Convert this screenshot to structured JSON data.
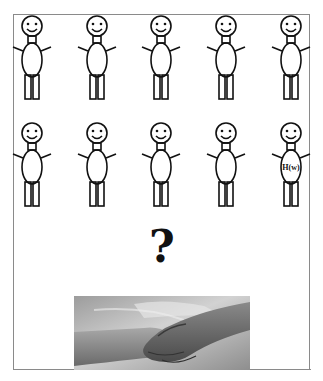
{
  "diagram": {
    "rows": [
      {
        "figures": [
          {
            "label": ""
          },
          {
            "label": ""
          },
          {
            "label": ""
          },
          {
            "label": ""
          },
          {
            "label": ""
          }
        ]
      },
      {
        "figures": [
          {
            "label": ""
          },
          {
            "label": ""
          },
          {
            "label": ""
          },
          {
            "label": ""
          },
          {
            "label": "H(w)"
          }
        ]
      }
    ],
    "question_mark": "?",
    "photo": {
      "subject": "handshake",
      "style": "grayscale"
    }
  }
}
